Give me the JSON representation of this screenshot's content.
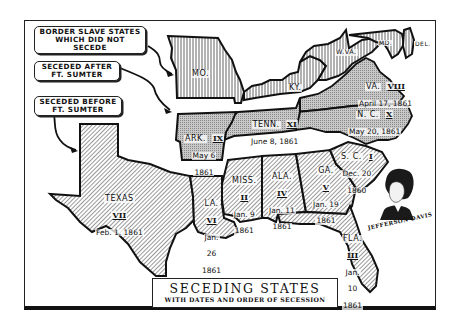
{
  "map": {
    "title": "SECEDING STATES",
    "subtitle": "WITH DATES AND ORDER OF SECESSION",
    "colors": {
      "border_states_fill": "#ffffff",
      "seceded_after_fill": "#b9b9b9",
      "seceded_before_fill": "#d8d8d8",
      "outline": "#111111"
    }
  },
  "legend": {
    "items": [
      {
        "label_line1": "BORDER SLAVE STATES",
        "label_line2": "WHICH DID NOT SECEDE",
        "pattern": "vertical-lines"
      },
      {
        "label_line1": "SECEDED AFTER",
        "label_line2": "FT. SUMTER",
        "pattern": "stipple"
      },
      {
        "label_line1": "SECEDED BEFORE",
        "label_line2": "FT. SUMTER",
        "pattern": "diagonal-lines"
      }
    ]
  },
  "border_states": [
    {
      "name": "MO."
    },
    {
      "name": "KY."
    },
    {
      "name": "W.VA."
    },
    {
      "name": "MD."
    },
    {
      "name": "DEL."
    }
  ],
  "seceded_after": [
    {
      "name": "VA.",
      "order": "VIII",
      "date": "April 17, 1861"
    },
    {
      "name": "N. C.",
      "order": "X",
      "date": "May 20, 1861"
    },
    {
      "name": "TENN.",
      "order": "XI",
      "date": "June 8, 1861"
    },
    {
      "name": "ARK.",
      "order": "IX",
      "date_line1": "May 6",
      "date_line2": "1861"
    }
  ],
  "seceded_before": [
    {
      "name": "TEXAS",
      "order": "VII",
      "date": "Feb. 1, 1861"
    },
    {
      "name": "LA.",
      "order": "VI",
      "date_line1": "Jan.",
      "date_line2": "26",
      "date_line3": "1861"
    },
    {
      "name": "MISS.",
      "order": "II",
      "date_line1": "Jan. 9",
      "date_line2": "1861"
    },
    {
      "name": "ALA.",
      "order": "IV",
      "date_line1": "Jan. 11",
      "date_line2": "1861"
    },
    {
      "name": "GA.",
      "order": "V",
      "date_line1": "Jan. 19",
      "date_line2": "1861"
    },
    {
      "name": "S. C.",
      "order": "I",
      "date_line1": "Dec. 20",
      "date_line2": "1860"
    },
    {
      "name": "FLA.",
      "order": "III",
      "date_line1": "Jan.",
      "date_line2": "10",
      "date_line3": "1861"
    }
  ],
  "portrait": {
    "caption": "JEFFERSON DAVIS"
  }
}
